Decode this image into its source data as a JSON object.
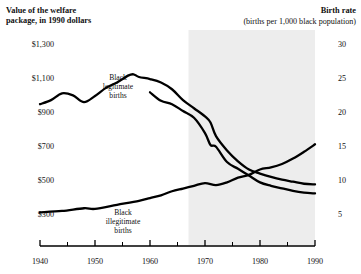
{
  "header": {
    "left_title_line1": "Value of the welfare",
    "left_title_line2": "package, in 1990 dollars",
    "right_title": "Birth rate",
    "right_subtitle": "(births per 1,000 black population)"
  },
  "annotations": {
    "legitimate": {
      "line1": "Black",
      "line2": "legitimate",
      "line3": "births"
    },
    "illegitimate": {
      "line1": "Black",
      "line2": "illegitimate",
      "line3": "births"
    },
    "welfare": {
      "line1": "Welfare",
      "line2": "package",
      "line3": "($)"
    }
  },
  "chart_data": {
    "type": "line",
    "title": "",
    "xlabel": "",
    "ylabel": "Value of the welfare package, in 1990 dollars",
    "y2label": "Birth rate (births per 1,000 black population)",
    "grid": false,
    "legend": "annotations-inline",
    "xlim": [
      1940,
      1990
    ],
    "ylim": [
      300,
      1300
    ],
    "y2lim": [
      5,
      30
    ],
    "xticks": [
      1940,
      1950,
      1960,
      1970,
      1980,
      1990
    ],
    "xticks_minor": [
      1945,
      1955,
      1965,
      1975,
      1985
    ],
    "yticks_left": [
      "$300",
      "$500",
      "$700",
      "$900",
      "$1,100",
      "$1,300"
    ],
    "yticks_left_values": [
      300,
      500,
      700,
      900,
      1100,
      1300
    ],
    "yticks_right": [
      "5",
      "10",
      "15",
      "20",
      "25",
      "30"
    ],
    "yticks_right_values": [
      5,
      10,
      15,
      20,
      25,
      30
    ],
    "shaded_region": {
      "x_start": 1967,
      "x_end": 1990,
      "color": "#ededed"
    },
    "series": [
      {
        "name": "Black legitimate births",
        "axis": "right",
        "units": "births per 1,000 black population",
        "x": [
          1940,
          1942,
          1944,
          1946,
          1948,
          1950,
          1952,
          1954,
          1956,
          1957,
          1958,
          1960,
          1962,
          1964,
          1966,
          1968,
          1970,
          1971,
          1972,
          1974,
          1976,
          1978,
          1980,
          1982,
          1984,
          1986,
          1988,
          1990
        ],
        "values": [
          21.0,
          21.6,
          22.6,
          22.3,
          21.3,
          22.2,
          23.4,
          24.2,
          25.2,
          25.4,
          25.0,
          24.7,
          24.2,
          23.2,
          21.6,
          20.4,
          19.2,
          18.3,
          16.3,
          14.2,
          12.6,
          11.4,
          10.8,
          10.3,
          9.9,
          9.6,
          9.3,
          9.2
        ]
      },
      {
        "name": "Black illegitimate births",
        "axis": "right",
        "units": "births per 1,000 black population",
        "x": [
          1940,
          1944,
          1948,
          1950,
          1954,
          1958,
          1960,
          1962,
          1964,
          1966,
          1968,
          1970,
          1972,
          1974,
          1976,
          1978,
          1980,
          1982,
          1984,
          1986,
          1988,
          1990
        ],
        "values": [
          5.1,
          5.3,
          5.7,
          5.6,
          6.2,
          6.8,
          7.2,
          7.6,
          8.2,
          8.6,
          9.0,
          9.4,
          9.1,
          9.5,
          10.2,
          10.6,
          11.4,
          11.7,
          12.2,
          13.0,
          14.0,
          15.1
        ]
      },
      {
        "name": "Welfare package ($)",
        "axis": "left",
        "units": "1990 dollars",
        "x": [
          1960,
          1962,
          1964,
          1966,
          1968,
          1970,
          1971,
          1972,
          1974,
          1976,
          1978,
          1980,
          1982,
          1984,
          1986,
          1988,
          1990
        ],
        "values": [
          1010,
          960,
          940,
          900,
          860,
          770,
          700,
          690,
          600,
          560,
          520,
          480,
          460,
          445,
          430,
          420,
          415
        ]
      }
    ]
  }
}
